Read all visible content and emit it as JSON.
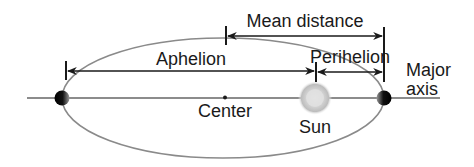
{
  "diagram": {
    "type": "orbit",
    "labels": {
      "mean_distance": "Mean distance",
      "aphelion": "Aphelion",
      "perihelion": "Perihelion",
      "major_axis_line1": "Major",
      "major_axis_line2": "axis",
      "center": "Center",
      "sun": "Sun"
    },
    "colors": {
      "orbit": "#8a8a8a",
      "line": "#1a1a1a",
      "sun": "#c8c8c8",
      "planet": "#111111"
    }
  }
}
